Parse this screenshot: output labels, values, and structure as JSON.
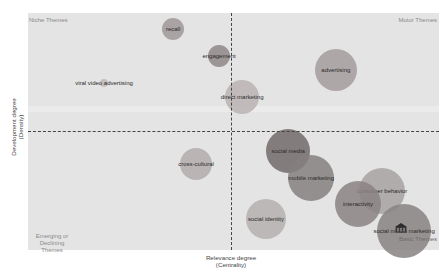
{
  "chart_data": {
    "type": "scatter",
    "subtype": "bubble",
    "title": "",
    "xlabel": "Relevance degree (Centrality)",
    "ylabel": "Development degree (Density)",
    "xlabel_lines": [
      "Relevance degree",
      "(Centrality)"
    ],
    "ylabel_lines": [
      "Development degree",
      "(Density)"
    ],
    "grid": false,
    "legend": "none",
    "quadrants": {
      "top_left": "Niche Themes",
      "top_right": "Motor Themes",
      "bottom_left": [
        "Emerging or",
        "Declining Themes"
      ],
      "bottom_right": "Basic Themes"
    },
    "reference_lines": {
      "x_dashed_at_pct": 49.3,
      "y_dashed_at_pct": 50.2
    },
    "points": [
      {
        "label": "recall",
        "x_pct": 35.3,
        "y_pct": 93.2,
        "size": 11,
        "color": "#a09898"
      },
      {
        "label": "engagement",
        "x_pct": 46.5,
        "y_pct": 81.9,
        "size": 11,
        "color": "#8f8787"
      },
      {
        "label": "viral video advertising",
        "x_pct": 18.5,
        "y_pct": 70.5,
        "size": 4,
        "color": "#bdb8b8"
      },
      {
        "label": "direct marketing",
        "x_pct": 52.1,
        "y_pct": 64.6,
        "size": 17,
        "color": "#bbb3b3"
      },
      {
        "label": "advertising",
        "x_pct": 74.9,
        "y_pct": 75.9,
        "size": 21,
        "color": "#a49c9c"
      },
      {
        "label": "cross-cultural",
        "x_pct": 40.9,
        "y_pct": 36.3,
        "size": 16,
        "color": "#b3abab"
      },
      {
        "label": "social media",
        "x_pct": 63.3,
        "y_pct": 41.8,
        "size": 22,
        "color": "#726a6a"
      },
      {
        "label": "mobile marketing",
        "x_pct": 68.9,
        "y_pct": 30.4,
        "size": 23,
        "color": "#858080"
      },
      {
        "label": "social identity",
        "x_pct": 57.9,
        "y_pct": 13.1,
        "size": 20,
        "color": "#b5b0b0"
      },
      {
        "label": "consumer behavior",
        "x_pct": 86.1,
        "y_pct": 24.9,
        "size": 23,
        "color": "#a7a2a2"
      },
      {
        "label": "interactivity",
        "x_pct": 80.3,
        "y_pct": 19.4,
        "size": 23,
        "color": "#8a8383"
      },
      {
        "label": "social media marketing",
        "x_pct": 91.5,
        "y_pct": 8.0,
        "size": 27,
        "color": "#888282"
      }
    ]
  },
  "colors": {
    "plot_background": "#e4e4e4",
    "dashed_line": "#444444",
    "quadrant_label": "#8a8a8a"
  }
}
